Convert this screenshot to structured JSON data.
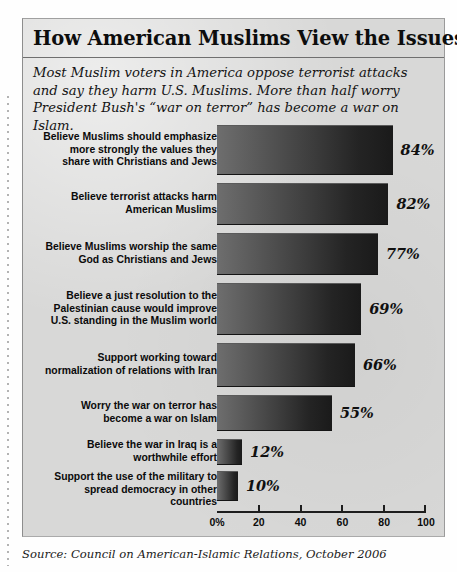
{
  "headline": "How American Muslims View the Issues",
  "deck": "Most Muslim voters in America oppose terrorist attacks and say they harm U.S. Muslims. More than half worry President Bush's “war on terror” has become a war on Islam.",
  "source": "Source: Council on American-Islamic Relations, October 2006",
  "colors": {
    "panel_background": "#d8d8d7",
    "page_background": "#fefefe",
    "bar_light": "#6e6e6e",
    "bar_dark": "#1a1a1a",
    "text": "#0b0b0b",
    "axis": "#1d1d1d"
  },
  "chart_data": {
    "type": "bar",
    "orientation": "horizontal",
    "title": "How American Muslims View the Issues",
    "subtitle": "Most Muslim voters in America oppose terrorist attacks and say they harm U.S. Muslims. More than half worry President Bush's “war on terror” has become a war on Islam.",
    "xlabel": "",
    "ylabel": "",
    "xlim": [
      0,
      100
    ],
    "grid": false,
    "legend": false,
    "source": "Source: Council on American-Islamic Relations, October 2006",
    "tick_labels": [
      "0%",
      "20",
      "40",
      "60",
      "80",
      "100"
    ],
    "tick_values": [
      0,
      20,
      40,
      60,
      80,
      100
    ],
    "categories": [
      "Believe Muslims should emphasize more strongly the values they share with Christians and Jews",
      "Believe terrorist attacks harm American Muslims",
      "Believe Muslims worship the same God as Christians and Jews",
      "Believe a just resolution to the Palestinian cause would improve U.S. standing in the Muslim world",
      "Support working toward normalization of relations with Iran",
      "Worry the war on terror has become a war on Islam",
      "Believe the war in Iraq is a worthwhile effort",
      "Support the use of the military to spread democracy in other countries"
    ],
    "values": [
      84,
      82,
      77,
      69,
      66,
      55,
      12,
      10
    ],
    "value_labels": [
      "84%",
      "82%",
      "77%",
      "69%",
      "66%",
      "55%",
      "12%",
      "10%"
    ]
  },
  "rows": [
    {
      "label_lines": [
        "Believe Muslims should emphasize",
        "more strongly the values they",
        "share with Christians and Jews"
      ],
      "value": 84,
      "value_label": "84%"
    },
    {
      "label_lines": [
        "Believe terrorist attacks harm",
        "American Muslims"
      ],
      "value": 82,
      "value_label": "82%"
    },
    {
      "label_lines": [
        "Believe Muslims worship the same",
        "God as Christians and Jews"
      ],
      "value": 77,
      "value_label": "77%"
    },
    {
      "label_lines": [
        "Believe a just resolution to the",
        "Palestinian cause would improve",
        "U.S. standing in the Muslim world"
      ],
      "value": 69,
      "value_label": "69%"
    },
    {
      "label_lines": [
        "Support working toward",
        "normalization of relations with Iran"
      ],
      "value": 66,
      "value_label": "66%"
    },
    {
      "label_lines": [
        "Worry the war on terror has",
        "become a war on Islam"
      ],
      "value": 55,
      "value_label": "55%"
    },
    {
      "label_lines": [
        "Believe the war in Iraq is a",
        "worthwhile effort"
      ],
      "value": 12,
      "value_label": "12%"
    },
    {
      "label_lines": [
        "Support the use of the military to",
        "spread democracy in other",
        "countries"
      ],
      "value": 10,
      "value_label": "10%"
    }
  ]
}
